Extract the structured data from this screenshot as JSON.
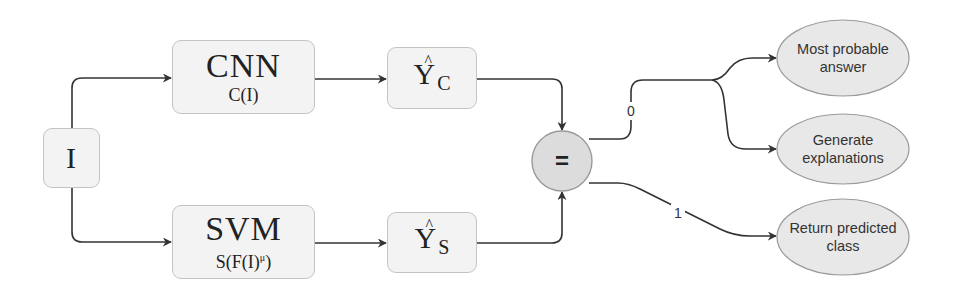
{
  "diagram": {
    "input_node": {
      "label": "I"
    },
    "cnn_node": {
      "title": "CNN",
      "formula": "C(I)"
    },
    "svm_node": {
      "title": "SVM",
      "formula_base": "S(F(I)",
      "formula_sup": "μ",
      "formula_end": ")"
    },
    "yc_node": {
      "var": "Y",
      "hat": "^",
      "subscript": "C"
    },
    "ys_node": {
      "var": "Y",
      "hat": "^",
      "subscript": "S"
    },
    "compare_node": {
      "label": "="
    },
    "edges": {
      "branch_0_label": "0",
      "branch_1_label": "1"
    },
    "outcomes": [
      {
        "line1": "Most probable",
        "line2": "answer"
      },
      {
        "line1": "Generate",
        "line2": "explanations"
      },
      {
        "line1": "Return predicted",
        "line2": "class"
      }
    ],
    "colors": {
      "box_fill": "#f3f3f3",
      "box_border": "#c4c4c4",
      "circle_fill": "#dcdcdc",
      "ellipse_fill": "#e8e8e8",
      "edge": "#333333"
    }
  }
}
